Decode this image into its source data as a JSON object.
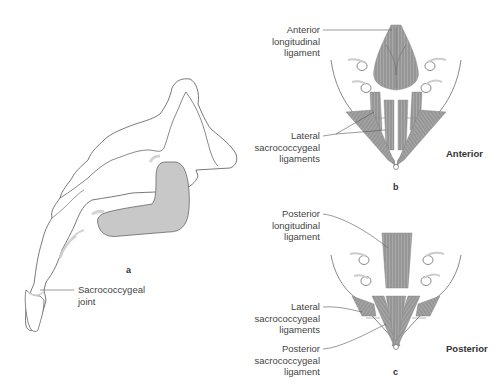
{
  "figure": {
    "colors": {
      "outline": "#555555",
      "ligament_fill": "#9a9a9a",
      "ligament_stroke": "#777777",
      "joint_fill": "#c8c8c8",
      "shadow": "#cfcfcf",
      "leader": "#555555",
      "background": "#ffffff"
    },
    "panels": [
      {
        "id": "a",
        "letter": "a",
        "view": "Lateral view of sacrum and coccyx",
        "labels": [
          {
            "lines": [
              "Sacrococcygeal",
              "joint"
            ]
          }
        ]
      },
      {
        "id": "b",
        "letter": "b",
        "view_title": "Anterior",
        "labels": [
          {
            "lines": [
              "Anterior",
              "longitudinal",
              "ligament"
            ]
          },
          {
            "lines": [
              "Lateral",
              "sacrococcygeal",
              "ligaments"
            ]
          }
        ]
      },
      {
        "id": "c",
        "letter": "c",
        "view_title": "Posterior",
        "labels": [
          {
            "lines": [
              "Posterior",
              "longitudinal",
              "ligament"
            ]
          },
          {
            "lines": [
              "Lateral",
              "sacrococcygeal",
              "ligaments"
            ]
          },
          {
            "lines": [
              "Posterior",
              "sacrococcygeal",
              "ligament"
            ]
          }
        ]
      }
    ]
  }
}
